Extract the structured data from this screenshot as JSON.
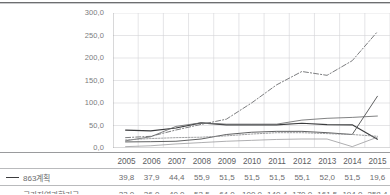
{
  "chart_data": {
    "type": "line",
    "title": "",
    "xlabel": "",
    "ylabel": "",
    "ylim": [
      0,
      300
    ],
    "yticks": [
      "0,0",
      "50,0",
      "100,0",
      "150,0",
      "200,0",
      "250,0",
      "300,0"
    ],
    "ytick_values": [
      0,
      50,
      100,
      150,
      200,
      250,
      300
    ],
    "grid": true,
    "legend_position": "below-table",
    "categories": [
      "2005",
      "2006",
      "2007",
      "2008",
      "2009",
      "2010",
      "2011",
      "2012",
      "2013",
      "2014",
      "2015"
    ],
    "series": [
      {
        "name": "863계획",
        "style": "solid-dark",
        "values": [
          39.8,
          37.9,
          44.4,
          55.9,
          51.5,
          51.5,
          51.5,
          55.1,
          52.0,
          51.5,
          19.6
        ]
      },
      {
        "name": "국가자연과학기금",
        "style": "dash-dot",
        "values": [
          23.0,
          26.0,
          40.0,
          52.5,
          64.0,
          100.0,
          140.4,
          170.0,
          161.5,
          194.0,
          258.4
        ]
      },
      {
        "name": "series-3",
        "style": "solid-gray",
        "values": [
          16.0,
          25.0,
          48.0,
          56.0,
          53.0,
          53.0,
          53.0,
          62.0,
          66.0,
          68.0,
          71.0
        ]
      },
      {
        "name": "series-4",
        "style": "solid-gray-2",
        "values": [
          13.5,
          14.0,
          15.0,
          20.0,
          30.0,
          35.0,
          37.0,
          37.0,
          34.0,
          30.0,
          115.0
        ]
      },
      {
        "name": "series-5",
        "style": "dotted-gray",
        "values": [
          18.0,
          21.0,
          23.0,
          24.0,
          27.0,
          31.0,
          34.0,
          34.0,
          32.0,
          30.0,
          26.0
        ]
      },
      {
        "name": "series-6",
        "style": "solid-light",
        "values": [
          3.0,
          5.0,
          9.0,
          12.0,
          15.0,
          17.0,
          19.0,
          20.0,
          20.0,
          3.0,
          24.0
        ]
      }
    ]
  },
  "axis": {
    "y_ticks": [
      "300,0",
      "250,0",
      "200,0",
      "150,0",
      "100,0",
      "50,0",
      "0,0"
    ]
  },
  "table": {
    "header": [
      "2005",
      "2006",
      "2007",
      "2008",
      "2009",
      "2010",
      "2011",
      "2012",
      "2013",
      "2014",
      "2015"
    ],
    "rows": [
      {
        "label": "863계획",
        "marker": "solid",
        "values": [
          "39,8",
          "37,9",
          "44,4",
          "55,9",
          "51,5",
          "51,5",
          "51,5",
          "55,1",
          "52,0",
          "51,5",
          "19,6"
        ]
      },
      {
        "label": "국가자연과학기금",
        "marker": "dashdot",
        "values": [
          "23,0",
          "26,0",
          "40,0",
          "52,5",
          "64,0",
          "100,0",
          "140,4",
          "170,0",
          "161,5",
          "194,0",
          "258,4"
        ]
      }
    ]
  }
}
